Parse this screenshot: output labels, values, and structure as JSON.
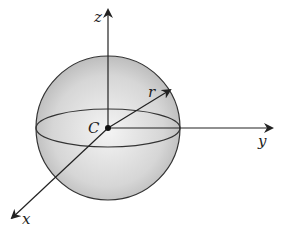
{
  "diagram": {
    "type": "sphere-coordinate-axes",
    "labels": {
      "z": "z",
      "y": "y",
      "x": "x",
      "r": "r",
      "center": "C"
    },
    "colors": {
      "sphere_fill_light": "#f2f2f2",
      "sphere_fill_dark": "#bdbdbd",
      "line": "#2a2a2a"
    }
  }
}
